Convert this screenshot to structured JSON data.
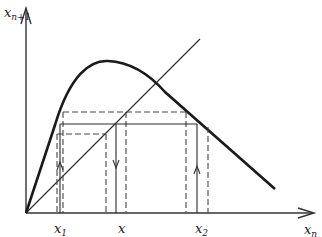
{
  "diagram": {
    "type": "cobweb-return-map",
    "y_axis_label": {
      "main": "x",
      "sub": "n+1"
    },
    "x_axis_label": {
      "main": "x",
      "sub": "n"
    },
    "tick_labels": [
      {
        "main": "x",
        "sub": "1"
      },
      {
        "main": "x",
        "sub": ""
      },
      {
        "main": "x",
        "sub": "2"
      }
    ],
    "elements": {
      "curve": "unimodal map f(x_n) rising steeply then falling linearly",
      "diagonal": "identity line x_{n+1} = x_n",
      "solid_orbit": "solid horizontal and vertical lines at x with arrows",
      "dashed_orbits": "two dashed rectangular neighboring orbits"
    },
    "colors": {
      "ink": "#1a1a1a",
      "background": "#ffffff"
    }
  }
}
